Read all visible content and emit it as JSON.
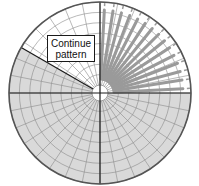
{
  "diagram": {
    "type": "polar-grid-pattern",
    "center": [
      100,
      93
    ],
    "radius": 91,
    "hub_radius": 8,
    "ring_count": 8,
    "spoke_count": 32,
    "shaded_sector": {
      "start_deg": 0,
      "end_deg": 210,
      "direction": "clockwise-from-east"
    },
    "slat_sector": {
      "start_deg": 270,
      "end_deg": 360,
      "slat_count": 15
    },
    "colors": {
      "background": "#ffffff",
      "grid_line": "#8a8a8a",
      "axis_line": "#1a1a1a",
      "outline": "#555555",
      "shade": "#d9d9d9",
      "slat": "#9a9a9a"
    },
    "label": {
      "line1": "Continue",
      "line2": "pattern"
    }
  }
}
